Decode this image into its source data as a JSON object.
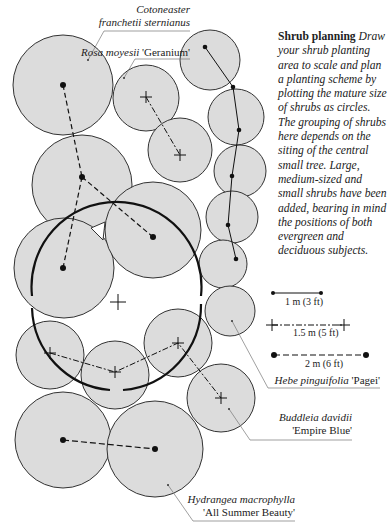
{
  "caption": {
    "title": "Shrub planning",
    "body": "Draw your shrub planting area to scale and plan a planting scheme by plotting the mature size of shrubs as circles. The grouping of shrubs here depends on the siting of the central small tree. Large, medium-sized and small shrubs have been added, bearing in mind the positions of both evergreen and deciduous subjects."
  },
  "labels": {
    "cotoneaster": {
      "genus": "Cotoneaster",
      "species": "franchetii sternianus"
    },
    "rosa": {
      "species": "Rosa moyesii",
      "cultivar": "'Geranium'"
    },
    "hebe": {
      "species": "Hebe pinguifolia",
      "cultivar": "'Pagei'"
    },
    "buddleia": {
      "species": "Buddleia davidii",
      "cultivar": "'Empire Blue'"
    },
    "hydrangea": {
      "species": "Hydrangea macrophylla",
      "cultivar": "'All Summer Beauty'"
    }
  },
  "legend": [
    {
      "marker": "dot",
      "line": "solid",
      "label": "1 m (3 ft)"
    },
    {
      "marker": "cross",
      "line": "dash-dot",
      "label": "1.5 m (5 ft)"
    },
    {
      "marker": "dot",
      "line": "dashed",
      "label": "2 m (6 ft)"
    }
  ],
  "colors": {
    "shrub_fill": "#dcdcdc",
    "outline": "#333333",
    "tree_canopy": "#111111",
    "leader": "#777777"
  }
}
